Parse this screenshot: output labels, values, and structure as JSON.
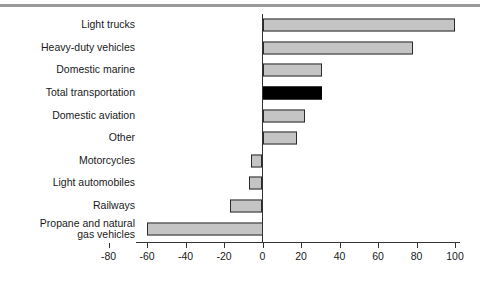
{
  "chart_data": {
    "type": "bar",
    "orientation": "horizontal",
    "title": "",
    "subtitle": "",
    "xlabel": "",
    "ylabel": "",
    "xlim": [
      -80,
      100
    ],
    "xticks": [
      -80,
      -60,
      -40,
      -20,
      0,
      20,
      40,
      60,
      80,
      100
    ],
    "xtick_labels": [
      "-80",
      "-60",
      "-40",
      "-20",
      "0",
      "20",
      "40",
      "60",
      "80",
      "100"
    ],
    "grid": false,
    "legend": null,
    "categories": [
      "Light trucks",
      "Heavy-duty vehicles",
      "Domestic marine",
      "Total transportation",
      "Domestic aviation",
      "Other",
      "Motorcycles",
      "Light automobiles",
      "Railways",
      "Propane and natural\ngas vehicles"
    ],
    "values": [
      100,
      78,
      31,
      31,
      22,
      18,
      -6,
      -7,
      -17,
      -60
    ],
    "highlight_index": 3,
    "colors": {
      "bar_fill": "#c4c4c4",
      "bar_edge": "#2b2b2b",
      "highlight_fill": "#000000",
      "axis": "#333333",
      "rule": "#9a9a9a",
      "text": "#1a1a1a"
    }
  },
  "axis_note": ""
}
